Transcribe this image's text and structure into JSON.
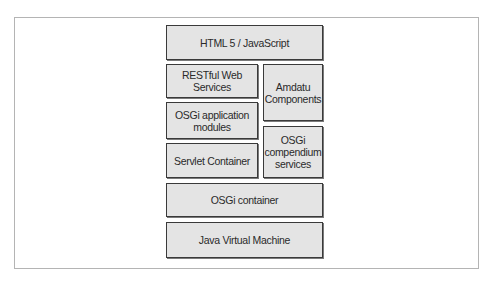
{
  "diagram": {
    "type": "layered-architecture-stack",
    "layers": {
      "html5": {
        "label": "HTML 5 / JavaScript"
      },
      "restful": {
        "label": "RESTful Web Services"
      },
      "osgi_app_modules": {
        "label": "OSGi application\nmodules"
      },
      "servlet_container": {
        "label": "Servlet Container"
      },
      "amdatu": {
        "label": "Amdatu\nComponents"
      },
      "osgi_compendium": {
        "label": "OSGi\ncompendium\nservices"
      },
      "osgi_container": {
        "label": "OSGi container"
      },
      "jvm": {
        "label": "Java Virtual Machine"
      }
    },
    "colors": {
      "box_fill": "#e4e4e4",
      "box_border": "#3a3a3a",
      "frame_border": "#b4b4b4",
      "text": "#2a2a2a"
    }
  }
}
